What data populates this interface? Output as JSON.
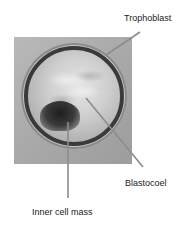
{
  "figure": {
    "labels": {
      "trophoblast": "Trophoblast",
      "blastocoel": "Blastocoel",
      "inner_cell_mass": "Inner cell mass"
    },
    "colors": {
      "leader_line": "#8c8c8c",
      "label_text": "#222222",
      "background": "#ffffff"
    }
  }
}
